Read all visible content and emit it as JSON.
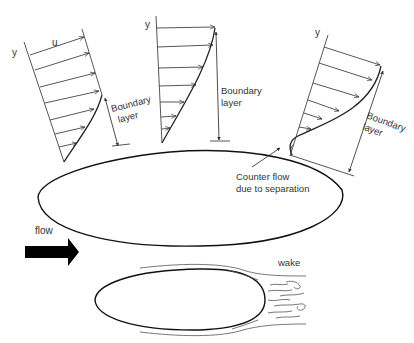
{
  "diagram": {
    "profiles": [
      {
        "id": "profile-1",
        "axis_label": "y",
        "velocity_label": "u",
        "annotation": [
          "Boundary",
          "layer"
        ]
      },
      {
        "id": "profile-2",
        "axis_label": "y",
        "annotation": [
          "Boundary",
          "layer"
        ]
      },
      {
        "id": "profile-3",
        "axis_label": "y",
        "annotation": [
          "Boundary",
          "layer"
        ]
      }
    ],
    "counter_flow_label": [
      "Counter flow",
      "due to separation"
    ],
    "flow_label": "flow",
    "wake_label": "wake",
    "colors": {
      "ink": "#222222",
      "text": "#333333",
      "arrow_fill": "#000000",
      "background": "#ffffff"
    }
  }
}
